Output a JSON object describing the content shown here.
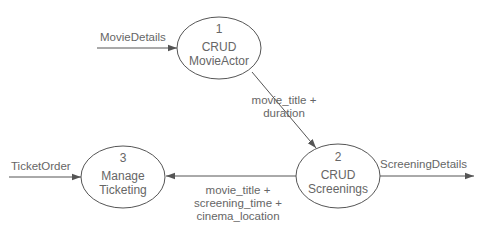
{
  "diagram": {
    "type": "data-flow-diagram",
    "colors": {
      "stroke": "#555555",
      "text": "#666666",
      "background": "#ffffff"
    },
    "processes": [
      {
        "id": "p1",
        "number": "1",
        "line1": "CRUD",
        "line2": "MovieActor"
      },
      {
        "id": "p2",
        "number": "2",
        "line1": "CRUD",
        "line2": "Screenings"
      },
      {
        "id": "p3",
        "number": "3",
        "line1": "Manage",
        "line2": "Ticketing"
      }
    ],
    "flows": [
      {
        "id": "f1",
        "from": "external",
        "to": "p1",
        "label_lines": [
          "MovieDetails"
        ]
      },
      {
        "id": "f2",
        "from": "p1",
        "to": "p2",
        "label_lines": [
          "movie_title +",
          "duration"
        ]
      },
      {
        "id": "f3",
        "from": "p2",
        "to": "external",
        "label_lines": [
          "ScreeningDetails"
        ]
      },
      {
        "id": "f4",
        "from": "p2",
        "to": "p3",
        "label_lines": [
          "movie_title +",
          "screening_time +",
          "cinema_location"
        ]
      },
      {
        "id": "f5",
        "from": "external",
        "to": "p3",
        "label_lines": [
          "TicketOrder"
        ]
      }
    ]
  }
}
